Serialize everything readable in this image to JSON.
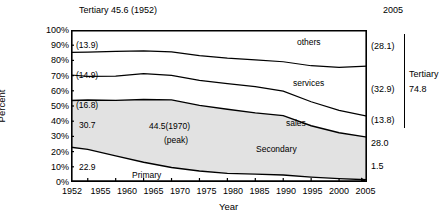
{
  "chart_data": {
    "type": "area",
    "title": "Tertiary 45.6 (1952)",
    "xlabel": "Year",
    "ylabel": "Percent",
    "grid": false,
    "legend": "inline-labels",
    "ylim": [
      0,
      100
    ],
    "ytick_labels": [
      "0%",
      "10%",
      "20%",
      "30%",
      "40%",
      "50%",
      "60%",
      "70%",
      "80%",
      "90%",
      "100%"
    ],
    "ytick_values": [
      0,
      10,
      20,
      30,
      40,
      50,
      60,
      70,
      80,
      90,
      100
    ],
    "xtick_labels": [
      "1952",
      "1955",
      "1960",
      "1965",
      "1970",
      "1975",
      "1980",
      "1985",
      "1990",
      "1995",
      "2000",
      "2005"
    ],
    "x": [
      1952,
      1955,
      1960,
      1965,
      1970,
      1975,
      1980,
      1985,
      1990,
      1995,
      2000,
      2005
    ],
    "stack_order_bottom_to_top": [
      "Primary",
      "Secondary",
      "sales",
      "services",
      "others"
    ],
    "series": [
      {
        "name": "Primary",
        "values": [
          22.9,
          21.5,
          17.2,
          13.0,
          9.5,
          7.2,
          5.7,
          5.2,
          4.6,
          3.2,
          2.2,
          1.5
        ]
      },
      {
        "name": "Secondary",
        "values": [
          30.7,
          32.4,
          36.5,
          41.3,
          44.5,
          43.2,
          42.2,
          40.3,
          39.1,
          33.8,
          30.2,
          28.0
        ]
      },
      {
        "name": "sales",
        "values": [
          16.8,
          15.6,
          16.0,
          17.0,
          16.1,
          16.5,
          16.8,
          17.2,
          16.1,
          15.8,
          14.7,
          13.8
        ]
      },
      {
        "name": "services",
        "values": [
          14.9,
          16.0,
          16.3,
          15.0,
          15.5,
          16.3,
          16.8,
          17.7,
          19.3,
          23.7,
          28.3,
          32.9
        ]
      },
      {
        "name": "others",
        "values": [
          14.7,
          14.5,
          14.0,
          13.7,
          14.4,
          16.8,
          18.5,
          19.6,
          20.9,
          23.5,
          24.6,
          23.8
        ]
      }
    ],
    "boundaries_cumulative": {
      "primary_top": [
        22.9,
        21.5,
        17.2,
        13.0,
        9.5,
        7.2,
        5.7,
        5.2,
        4.6,
        3.2,
        2.2,
        1.5
      ],
      "secondary_top": [
        53.6,
        53.9,
        53.7,
        54.3,
        54.0,
        50.4,
        47.9,
        45.5,
        43.7,
        37.0,
        32.4,
        29.5
      ],
      "sales_top": [
        70.4,
        69.5,
        69.7,
        71.3,
        70.1,
        66.9,
        64.7,
        62.7,
        59.8,
        52.8,
        47.1,
        43.3
      ],
      "services_top": [
        85.3,
        85.5,
        86.0,
        86.3,
        85.6,
        83.2,
        81.5,
        80.4,
        79.1,
        76.5,
        75.4,
        76.2
      ]
    },
    "area_labels": [
      {
        "text": "others",
        "value": null
      },
      {
        "text": "services",
        "value": null
      },
      {
        "text": "sales",
        "value": null
      },
      {
        "text": "Secondary",
        "value": null
      },
      {
        "text": "Primary",
        "value": null
      }
    ],
    "annotations": [
      {
        "text": "44.5(1970)",
        "note": "secondary peak value"
      },
      {
        "text": "(peak)",
        "note": "secondary peak label"
      }
    ],
    "left_values_1952": [
      "(13.9)",
      "(14.9)",
      "(16.8)",
      "30.7",
      "22.9"
    ],
    "right_values_2005": [
      "(28.1)",
      "(32.9)",
      "(13.8)",
      "28.0",
      "1.5"
    ],
    "right_bracket": {
      "label": "Tertiary",
      "value": "74.8"
    },
    "right_header": "2005"
  },
  "header": {
    "title": "Tertiary 45.6 (1952)",
    "right_year": "2005"
  },
  "axes": {
    "y_title": "Percent",
    "x_title": "Year",
    "y_ticks": [
      "100%",
      "90%",
      "80%",
      "70%",
      "60%",
      "50%",
      "40%",
      "30%",
      "20%",
      "10%",
      "0%"
    ],
    "x_ticks": [
      "1952",
      "1955",
      "1960",
      "1965",
      "1970",
      "1975",
      "1980",
      "1985",
      "1990",
      "1995",
      "2000",
      "2005"
    ]
  },
  "area_labels": {
    "others": "others",
    "services": "services",
    "sales": "sales",
    "secondary": "Secondary",
    "primary": "Primary"
  },
  "left_labels": {
    "others": "(13.9)",
    "services": "(14.9)",
    "sales": "(16.8)",
    "secondary": "30.7",
    "primary": "22.9"
  },
  "right_labels": {
    "others": "(28.1)",
    "services": "(32.9)",
    "sales": "(13.8)",
    "secondary": "28.0",
    "primary": "1.5",
    "bracket_label": "Tertiary",
    "bracket_value": "74.8"
  },
  "annotations": {
    "peak_value": "44.5(1970)",
    "peak_note": "(peak)"
  },
  "colors": {
    "line": "#000000",
    "secondary_fill": "#e0e0e0",
    "background": "#ffffff"
  }
}
